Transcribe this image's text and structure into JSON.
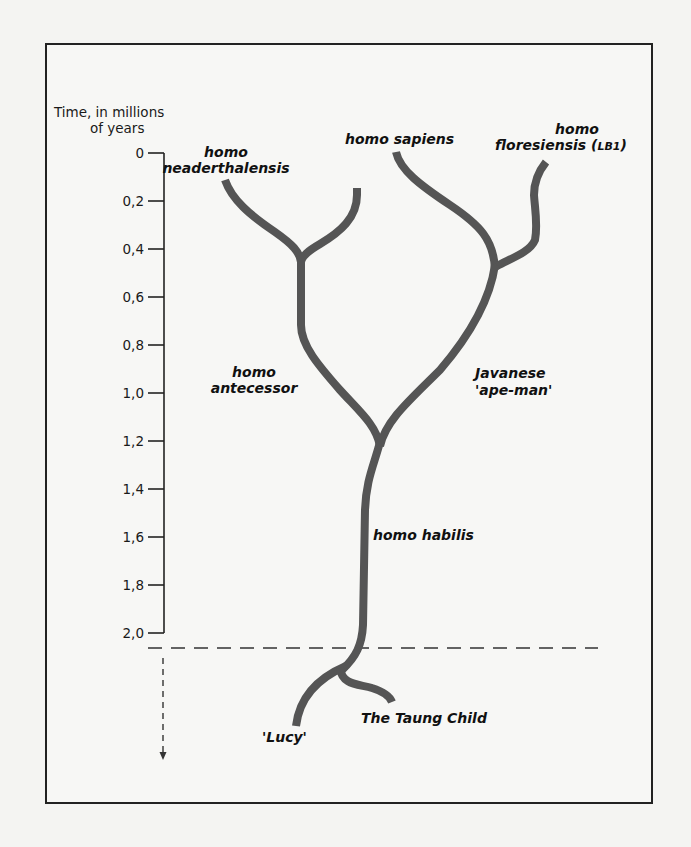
{
  "diagram": {
    "type": "phylogenetic-tree",
    "axis": {
      "title_line1": "Time, in millions",
      "title_line2": "of years",
      "ticks": [
        "0",
        "0,2",
        "0,4",
        "0,6",
        "0,8",
        "1,0",
        "1,2",
        "1,4",
        "1,6",
        "1,8",
        "2,0"
      ],
      "range": [
        0,
        2.0
      ],
      "direction": "downward (older)"
    },
    "labels": {
      "neanderthalensis_line1": "homo",
      "neanderthalensis_line2": "neaderthalensis",
      "sapiens": "homo sapiens",
      "floresiensis_line1": "homo",
      "floresiensis_line2": "floresiensis (",
      "floresiensis_code": "LB1",
      "floresiensis_close": ")",
      "antecessor_line1": "homo",
      "antecessor_line2": "antecessor",
      "javanese_line1": "Javanese",
      "javanese_line2": "'ape-man'",
      "habilis": "homo habilis",
      "lucy": "'Lucy'",
      "taung": "The Taung Child"
    },
    "colors": {
      "branch": "#555555",
      "text": "#111111",
      "border": "#222222"
    }
  }
}
